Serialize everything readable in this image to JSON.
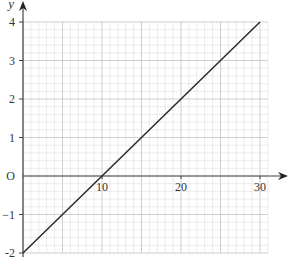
{
  "chart_data": {
    "type": "line",
    "title": "",
    "xlabel": "x",
    "ylabel": "y",
    "origin_label": "O",
    "xlim": [
      0,
      31
    ],
    "ylim": [
      -2,
      4
    ],
    "x_ticks": [
      10,
      20,
      30
    ],
    "x_tick_labels": [
      "10",
      "20",
      "30"
    ],
    "y_ticks": [
      -2,
      -1,
      1,
      2,
      3,
      4
    ],
    "y_tick_labels": [
      "-2",
      "−1",
      "1",
      "2",
      "3",
      "4"
    ],
    "grid": true,
    "grid_minor_x": 1,
    "grid_minor_y": 0.2,
    "series": [
      {
        "name": "line",
        "x": [
          0,
          30
        ],
        "y": [
          -2,
          4
        ],
        "color": "#2a2a2a"
      }
    ]
  },
  "colors": {
    "grid_minor": "#dddddd",
    "grid_major": "#c8c8c8",
    "axis": "#444444"
  }
}
